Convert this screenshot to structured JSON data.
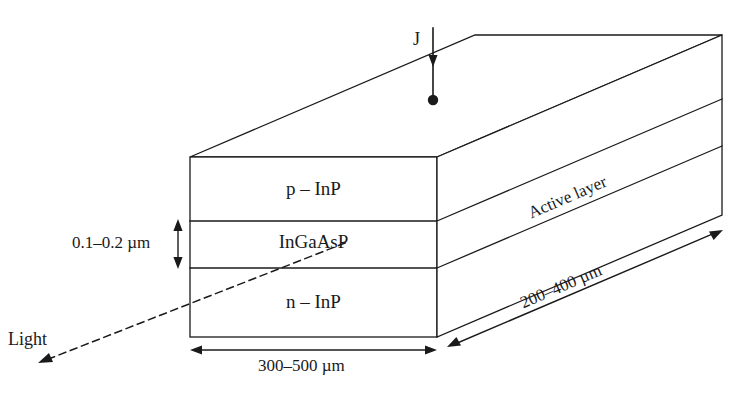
{
  "diagram": {
    "background_color": "#ffffff",
    "line_color": "#1a1a1a",
    "layers": [
      {
        "name": "p-inp",
        "label": "p – InP"
      },
      {
        "name": "ingaasp",
        "label": "InGaAsP"
      },
      {
        "name": "n-inp",
        "label": "n – InP"
      }
    ],
    "annotations": {
      "current_density": "J",
      "active_layer": "Active layer",
      "light_output": "Light"
    },
    "dimensions": {
      "active_layer_thickness": "0.1–0.2 µm",
      "width": "300–500 µm",
      "depth": "200–400 µm"
    }
  }
}
